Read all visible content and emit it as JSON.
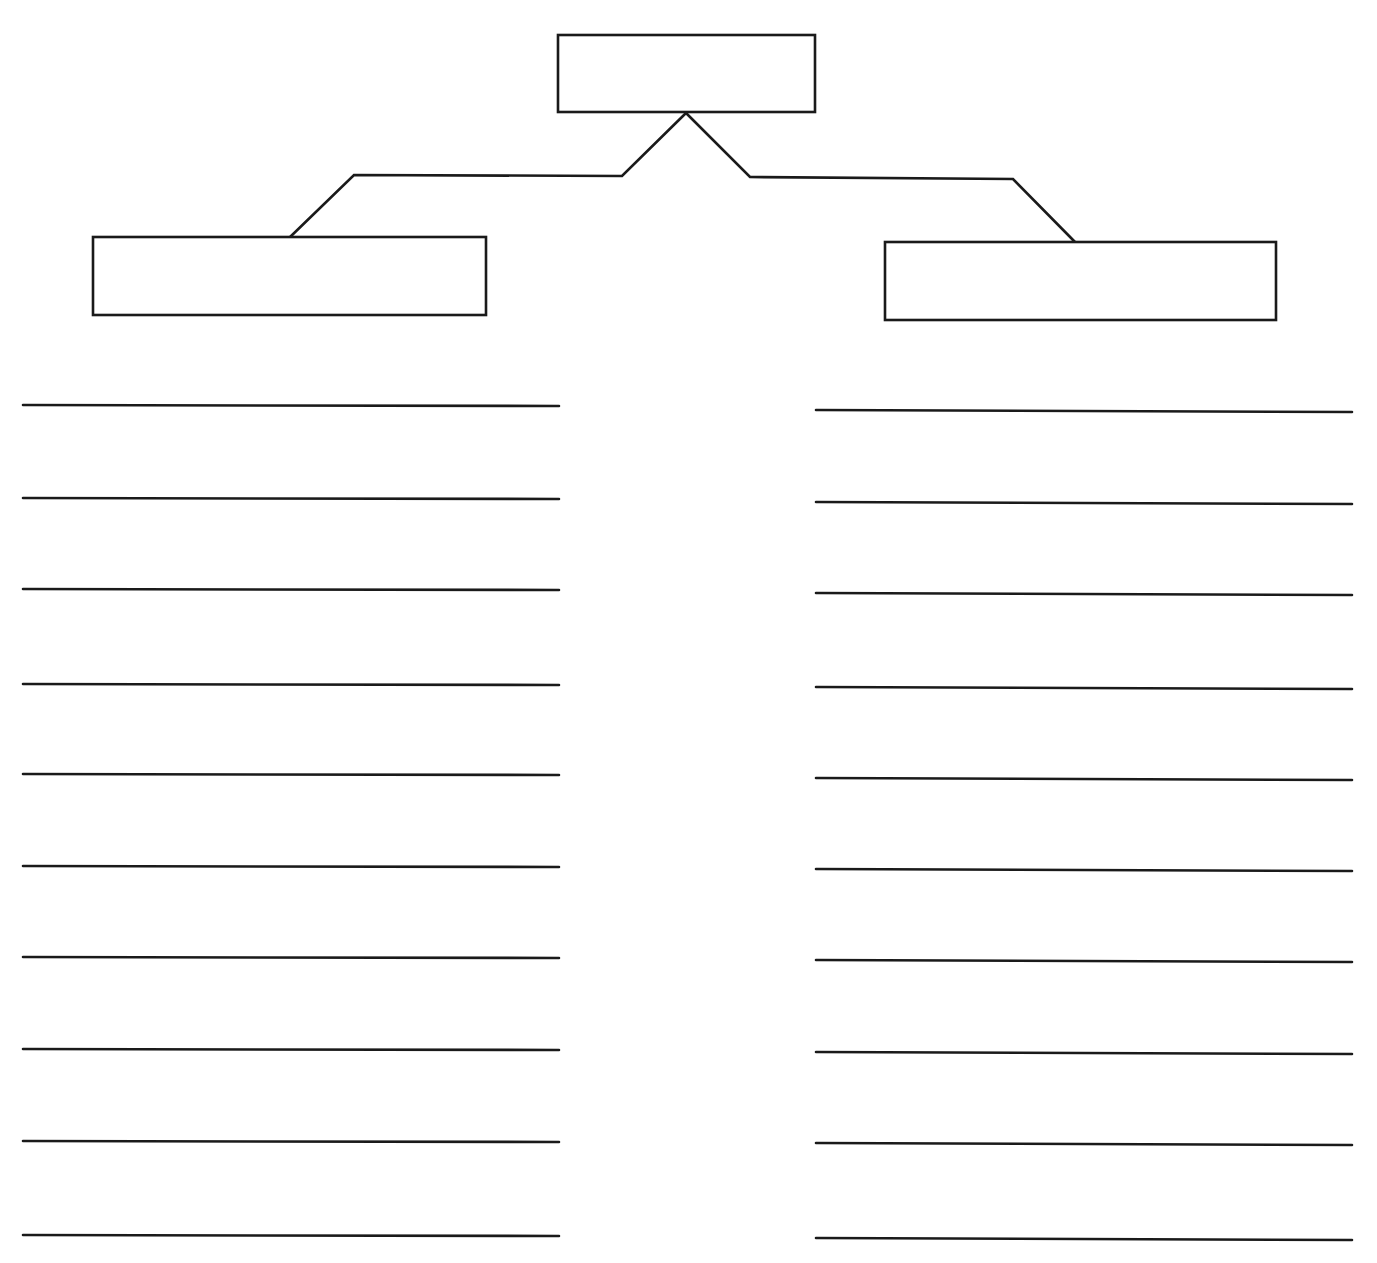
{
  "canvas": {
    "width": 1377,
    "height": 1263,
    "background": "#ffffff",
    "stroke_color": "#1a1a1a"
  },
  "diagram": {
    "type": "tree-graphic-organizer",
    "root_box": {
      "label": "",
      "x": 558,
      "y": 35,
      "w": 257,
      "h": 77
    },
    "branches": [
      {
        "name": "left",
        "box": {
          "label": "",
          "x": 93,
          "y": 237,
          "w": 393,
          "h": 78
        },
        "connector": [
          [
            686,
            113
          ],
          [
            622,
            176
          ],
          [
            354,
            175
          ],
          [
            288,
            239
          ]
        ],
        "lines": {
          "x1": 23,
          "x2": 559,
          "ys": [
            405,
            498,
            589,
            684,
            774,
            866,
            957,
            1049,
            1141,
            1235
          ],
          "entries": [
            "",
            "",
            "",
            "",
            "",
            "",
            "",
            "",
            "",
            ""
          ]
        }
      },
      {
        "name": "right",
        "box": {
          "label": "",
          "x": 885,
          "y": 242,
          "w": 391,
          "h": 78
        },
        "connector": [
          [
            686,
            113
          ],
          [
            750,
            177
          ],
          [
            1013,
            179
          ],
          [
            1076,
            243
          ]
        ],
        "lines": {
          "x1": 816,
          "x2": 1352,
          "ys": [
            410,
            502,
            593,
            687,
            778,
            869,
            960,
            1052,
            1143,
            1238
          ],
          "entries": [
            "",
            "",
            "",
            "",
            "",
            "",
            "",
            "",
            "",
            ""
          ]
        }
      }
    ]
  }
}
